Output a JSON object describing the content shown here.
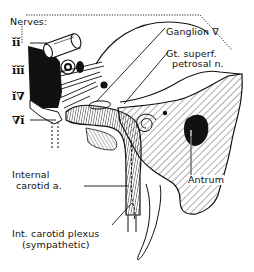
{
  "diagram": {
    "title_label": "Nerves:",
    "nerve_labels": [
      {
        "id": "ii",
        "text": "ĭĭ"
      },
      {
        "id": "iii",
        "text": "ĭĭĭ"
      },
      {
        "id": "iv",
        "text": "ĭ∇"
      },
      {
        "id": "vi",
        "text": "∇ĭ"
      }
    ],
    "labels": {
      "ganglion": "Ganglion ∇",
      "gt_superf_line1": "Gt. superf.",
      "gt_superf_line2": "petrosal n.",
      "internal_carotid_line1": "Internal",
      "internal_carotid_line2": "carotid a.",
      "antrum": "Antrum",
      "plexus_line1": "Int. carotid plexus",
      "plexus_line2": "(sympathetic)"
    },
    "colors": {
      "ink": "#111111",
      "paper": "#ffffff"
    }
  }
}
